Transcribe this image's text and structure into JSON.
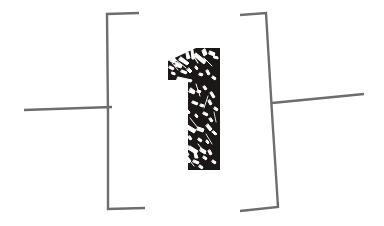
{
  "artwork": {
    "title": "Bracketed numeral one",
    "background_color": "#ffffff",
    "numeral": {
      "label": "1",
      "name": "numeral-one",
      "fill_color": "#1a1716",
      "texture": "distressed-speckled",
      "texture_color": "#ffffff",
      "bounds": {
        "x": 168,
        "y": 48,
        "width": 52,
        "height": 123
      }
    },
    "left_bracket": {
      "label": "[",
      "name": "left-bracket",
      "stroke_color": "#6e6e6e",
      "stroke_width": 2.4,
      "style": "upright",
      "points": "139,13 107,14 108,115 108,209 145,208"
    },
    "right_bracket": {
      "label": "]",
      "name": "right-bracket",
      "stroke_color": "#6e6e6e",
      "stroke_width": 2.4,
      "style": "slanted",
      "points": "240,15 266,13 272,113 278,207 240,211"
    },
    "left_rule": {
      "name": "left-horizontal-rule",
      "stroke_color": "#6e6e6e",
      "stroke_width": 2.4,
      "x1": 24,
      "y1": 110,
      "x2": 112,
      "y2": 107
    },
    "right_rule": {
      "name": "right-horizontal-rule",
      "stroke_color": "#6e6e6e",
      "stroke_width": 2.4,
      "x1": 272,
      "y1": 103,
      "x2": 364,
      "y2": 94
    }
  }
}
